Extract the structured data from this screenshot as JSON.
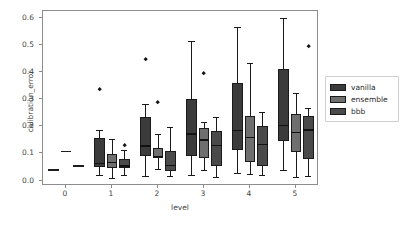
{
  "chart_data": {
    "type": "box",
    "title": "",
    "xlabel": "level",
    "ylabel": "calibration_error",
    "xlim": [
      -0.5,
      5.5
    ],
    "ylim": [
      -0.02,
      0.625
    ],
    "grid": false,
    "categories": [
      "0",
      "1",
      "2",
      "3",
      "4",
      "5"
    ],
    "yticks": [
      "0.0",
      "0.1",
      "0.2",
      "0.3",
      "0.4",
      "0.5",
      "0.6"
    ],
    "ytick_values": [
      0.0,
      0.1,
      0.2,
      0.3,
      0.4,
      0.5,
      0.6
    ],
    "legend": {
      "position": "right-outside",
      "entries": [
        {
          "name": "vanilla",
          "color": "#3b3b3b"
        },
        {
          "name": "ensemble",
          "color": "#6f6f6f"
        },
        {
          "name": "bbb",
          "color": "#4a4a4a"
        }
      ]
    },
    "series": [
      {
        "name": "vanilla",
        "color": "#3b3b3b",
        "boxes": [
          {
            "level": "0",
            "whisker_low": 0.04,
            "q1": 0.04,
            "median": 0.04,
            "q3": 0.04,
            "whisker_high": 0.04,
            "fliers": []
          },
          {
            "level": "1",
            "whisker_low": 0.02,
            "q1": 0.05,
            "median": 0.063,
            "q3": 0.157,
            "whisker_high": 0.188,
            "fliers": [
              0.335
            ]
          },
          {
            "level": "2",
            "whisker_low": 0.017,
            "q1": 0.092,
            "median": 0.127,
            "q3": 0.236,
            "whisker_high": 0.281,
            "fliers": [
              0.447
            ]
          },
          {
            "level": "3",
            "whisker_low": 0.02,
            "q1": 0.092,
            "median": 0.172,
            "q3": 0.302,
            "whisker_high": 0.516,
            "fliers": []
          },
          {
            "level": "4",
            "whisker_low": 0.027,
            "q1": 0.111,
            "median": 0.185,
            "q3": 0.359,
            "whisker_high": 0.565,
            "fliers": []
          },
          {
            "level": "5",
            "whisker_low": 0.04,
            "q1": 0.144,
            "median": 0.204,
            "q3": 0.41,
            "whisker_high": 0.6,
            "fliers": []
          }
        ]
      },
      {
        "name": "ensemble",
        "color": "#6f6f6f",
        "boxes": [
          {
            "level": "0",
            "whisker_low": 0.107,
            "q1": 0.107,
            "median": 0.107,
            "q3": 0.107,
            "whisker_high": 0.107,
            "fliers": []
          },
          {
            "level": "1",
            "whisker_low": 0.011,
            "q1": 0.047,
            "median": 0.067,
            "q3": 0.099,
            "whisker_high": 0.152,
            "fliers": []
          },
          {
            "level": "2",
            "whisker_low": 0.041,
            "q1": 0.082,
            "median": 0.089,
            "q3": 0.119,
            "whisker_high": 0.172,
            "fliers": [
              0.287
            ]
          },
          {
            "level": "3",
            "whisker_low": 0.04,
            "q1": 0.082,
            "median": 0.15,
            "q3": 0.192,
            "whisker_high": 0.216,
            "fliers": [
              0.394
            ]
          },
          {
            "level": "4",
            "whisker_low": 0.023,
            "q1": 0.068,
            "median": 0.16,
            "q3": 0.237,
            "whisker_high": 0.433,
            "fliers": []
          },
          {
            "level": "5",
            "whisker_low": 0.015,
            "q1": 0.105,
            "median": 0.176,
            "q3": 0.247,
            "whisker_high": 0.323,
            "fliers": []
          }
        ]
      },
      {
        "name": "bbb",
        "color": "#4a4a4a",
        "boxes": [
          {
            "level": "0",
            "whisker_low": 0.053,
            "q1": 0.053,
            "median": 0.053,
            "q3": 0.053,
            "whisker_high": 0.053,
            "fliers": []
          },
          {
            "level": "1",
            "whisker_low": 0.022,
            "q1": 0.046,
            "median": 0.054,
            "q3": 0.079,
            "whisker_high": 0.114,
            "fliers": [
              0.128
            ]
          },
          {
            "level": "2",
            "whisker_low": 0.018,
            "q1": 0.037,
            "median": 0.055,
            "q3": 0.108,
            "whisker_high": 0.199,
            "fliers": []
          },
          {
            "level": "3",
            "whisker_low": 0.014,
            "q1": 0.053,
            "median": 0.13,
            "q3": 0.181,
            "whisker_high": 0.233,
            "fliers": []
          },
          {
            "level": "4",
            "whisker_low": 0.021,
            "q1": 0.053,
            "median": 0.134,
            "q3": 0.2,
            "whisker_high": 0.253,
            "fliers": []
          },
          {
            "level": "5",
            "whisker_low": 0.018,
            "q1": 0.08,
            "median": 0.186,
            "q3": 0.238,
            "whisker_high": 0.268,
            "fliers": [
              0.492
            ]
          }
        ]
      }
    ]
  }
}
